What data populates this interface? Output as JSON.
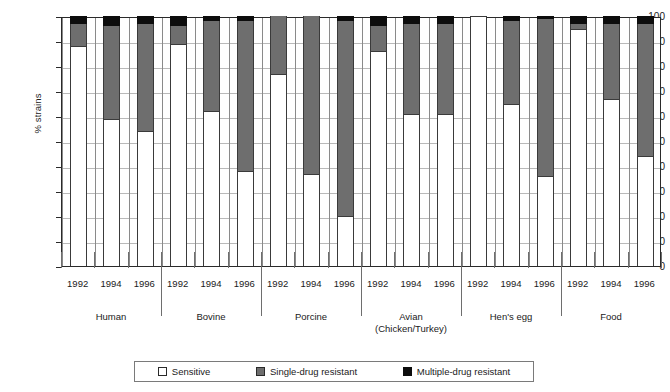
{
  "chart_data": {
    "type": "bar",
    "subtype": "stacked-bar-percent",
    "title": "",
    "xlabel": "",
    "ylabel": "% strains",
    "ylim": [
      0,
      100
    ],
    "yticks": [
      0,
      10,
      20,
      30,
      40,
      50,
      60,
      70,
      80,
      90,
      100
    ],
    "grid": true,
    "legend_position": "bottom",
    "legend": [
      {
        "label": "Sensitive",
        "color": "#ffffff"
      },
      {
        "label": "Single-drug resistant",
        "color": "#6e6e6e"
      },
      {
        "label": "Multiple-drug resistant",
        "color": "#0d0d0d"
      }
    ],
    "series": [
      {
        "name": "Sensitive",
        "color": "#ffffff"
      },
      {
        "name": "Single-drug resistant",
        "color": "#6e6e6e"
      },
      {
        "name": "Multiple-drug resistant",
        "color": "#0d0d0d"
      }
    ],
    "categories": [
      "1992",
      "1994",
      "1996"
    ],
    "groups": [
      {
        "name": "Human",
        "sublabel": "",
        "bars": [
          {
            "year": "1992",
            "sensitive": 88,
            "single": 9,
            "multiple": 3
          },
          {
            "year": "1994",
            "sensitive": 59,
            "single": 37,
            "multiple": 4
          },
          {
            "year": "1996",
            "sensitive": 54,
            "single": 43,
            "multiple": 3
          }
        ]
      },
      {
        "name": "Bovine",
        "sublabel": "",
        "bars": [
          {
            "year": "1992",
            "sensitive": 89,
            "single": 7,
            "multiple": 4
          },
          {
            "year": "1994",
            "sensitive": 62,
            "single": 36,
            "multiple": 2
          },
          {
            "year": "1996",
            "sensitive": 38,
            "single": 60,
            "multiple": 2
          }
        ]
      },
      {
        "name": "Porcine",
        "sublabel": "",
        "bars": [
          {
            "year": "1992",
            "sensitive": 77,
            "single": 23,
            "multiple": 0
          },
          {
            "year": "1994",
            "sensitive": 37,
            "single": 63,
            "multiple": 0
          },
          {
            "year": "1996",
            "sensitive": 20,
            "single": 78,
            "multiple": 2
          }
        ]
      },
      {
        "name": "Avian",
        "sublabel": "(Chicken/Turkey)",
        "bars": [
          {
            "year": "1992",
            "sensitive": 86,
            "single": 10,
            "multiple": 4
          },
          {
            "year": "1994",
            "sensitive": 61,
            "single": 36,
            "multiple": 3
          },
          {
            "year": "1996",
            "sensitive": 61,
            "single": 36,
            "multiple": 3
          }
        ]
      },
      {
        "name": "Hen's egg",
        "sublabel": "",
        "bars": [
          {
            "year": "1992",
            "sensitive": 100,
            "single": 0,
            "multiple": 0
          },
          {
            "year": "1994",
            "sensitive": 65,
            "single": 33,
            "multiple": 2
          },
          {
            "year": "1996",
            "sensitive": 36,
            "single": 63,
            "multiple": 1
          }
        ]
      },
      {
        "name": "Food",
        "sublabel": "",
        "bars": [
          {
            "year": "1992",
            "sensitive": 95,
            "single": 2,
            "multiple": 3
          },
          {
            "year": "1994",
            "sensitive": 67,
            "single": 30,
            "multiple": 3
          },
          {
            "year": "1996",
            "sensitive": 44,
            "single": 53,
            "multiple": 3
          }
        ]
      }
    ]
  },
  "axis": {
    "ylabel": "% strains"
  }
}
